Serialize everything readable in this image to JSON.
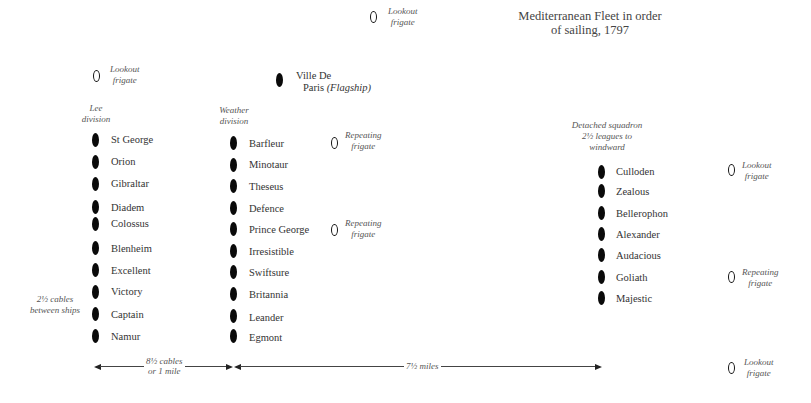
{
  "title": {
    "line1": "Mediterranean Fleet in order",
    "line2": "of sailing, 1797"
  },
  "frigates": {
    "top_lookout": {
      "line1": "Lookout",
      "line2": "frigate"
    },
    "left_lookout": {
      "line1": "Lookout",
      "line2": "frigate"
    },
    "repeating_1": {
      "line1": "Repeating",
      "line2": "frigate"
    },
    "repeating_2": {
      "line1": "Repeating",
      "line2": "frigate"
    },
    "right_lookout": {
      "line1": "Lookout",
      "line2": "frigate"
    },
    "right_repeating": {
      "line1": "Repeating",
      "line2": "frigate"
    },
    "bottom_lookout": {
      "line1": "Lookout",
      "line2": "frigate"
    }
  },
  "flagship": {
    "name_line1": "Ville De",
    "name_line2": "Paris",
    "note": "(Flagship)"
  },
  "divisions": {
    "lee": {
      "label_line1": "Lee",
      "label_line2": "division",
      "ships": [
        "St George",
        "Orion",
        "Gibraltar",
        "Diadem",
        "Colossus",
        "Blenheim",
        "Excellent",
        "Victory",
        "Captain",
        "Namur"
      ]
    },
    "weather": {
      "label_line1": "Weather",
      "label_line2": "division",
      "ships": [
        "Barfleur",
        "Minotaur",
        "Theseus",
        "Defence",
        "Prince George",
        "Irresistible",
        "Swiftsure",
        "Britannia",
        "Leander",
        "Egmont"
      ]
    },
    "detached": {
      "label_line1": "Detached squadron",
      "label_line2": "2½ leagues to",
      "label_line3": "windward",
      "ships": [
        "Culloden",
        "Zealous",
        "Bellerophon",
        "Alexander",
        "Audacious",
        "Goliath",
        "Majestic"
      ]
    }
  },
  "annotations": {
    "spacing_line1": "2½ cables",
    "spacing_line2": "between ships",
    "distance1_line1": "8½ cables",
    "distance1_line2": "or 1 mile",
    "distance2": "7½ miles"
  },
  "colors": {
    "ship": "#0a0a0a",
    "text": "#333333",
    "background": "#ffffff"
  }
}
